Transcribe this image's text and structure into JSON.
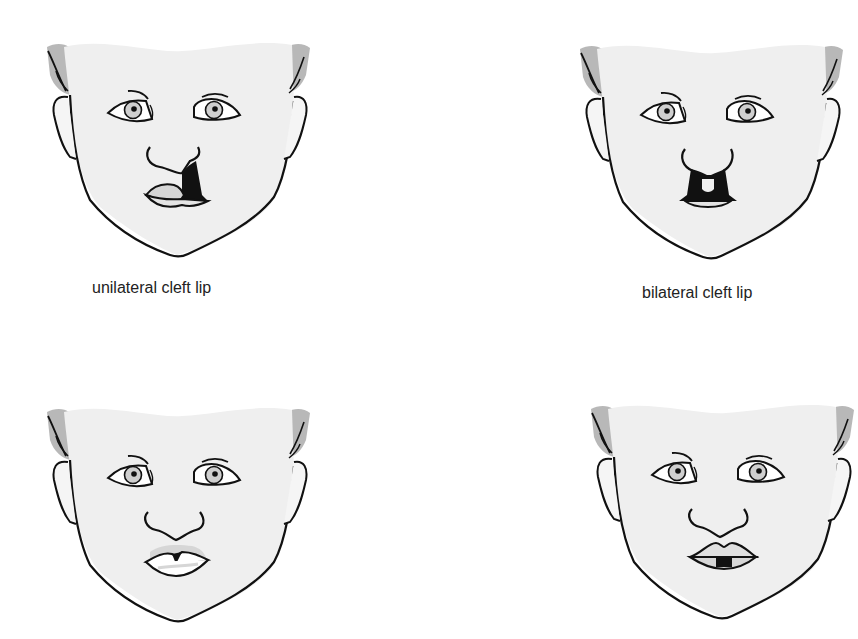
{
  "figure": {
    "panels": [
      {
        "id": "unilateral",
        "label": "unilateral cleft lip",
        "mouth": "unilateral-cleft"
      },
      {
        "id": "bilateral",
        "label": "bilateral cleft lip",
        "mouth": "bilateral-cleft"
      },
      {
        "id": "lip-notch",
        "label": "",
        "mouth": "incomplete-notch"
      },
      {
        "id": "lip-gap",
        "label": "",
        "mouth": "lower-lip-gap"
      }
    ]
  },
  "colors": {
    "skin": "#efefef",
    "hair": "#b8b8b8",
    "line": "#111111",
    "lip_fill": "#d6d6d6",
    "iris": "#cfcfcf",
    "caption": "#222222",
    "background": "#ffffff"
  }
}
